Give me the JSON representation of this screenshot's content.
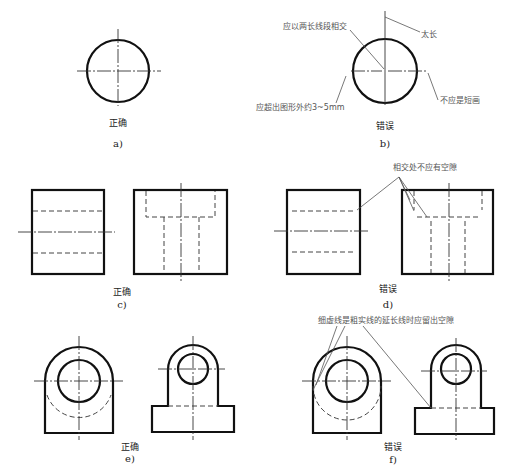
{
  "figure": {
    "panels": [
      {
        "id": "a",
        "caption": "a)",
        "verdict": "正确"
      },
      {
        "id": "b",
        "caption": "b)",
        "verdict": "错误",
        "notes": [
          "应以两长线段相交",
          "太长",
          "应超出图形外约3~5mm",
          "不应是短画"
        ]
      },
      {
        "id": "c",
        "caption": "c)",
        "verdict": "正确"
      },
      {
        "id": "d",
        "caption": "d)",
        "verdict": "错误",
        "notes": [
          "相交处不应有空隙"
        ]
      },
      {
        "id": "e",
        "caption": "e)",
        "verdict": "正确"
      },
      {
        "id": "f",
        "caption": "f)",
        "verdict": "错误",
        "notes": [
          "细虚线是粗实线的延长线时应留出空隙"
        ]
      }
    ]
  },
  "colors": {
    "line": "#111111",
    "thin": "#333333",
    "note": "#555555",
    "background": "#ffffff"
  }
}
